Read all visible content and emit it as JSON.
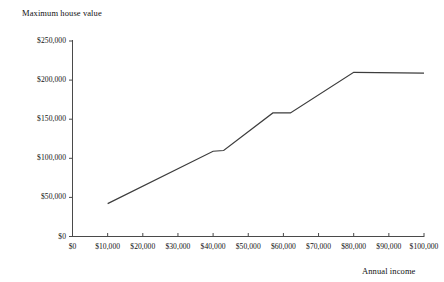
{
  "chart_data": {
    "type": "line",
    "title": "",
    "xlabel": "Annual income",
    "ylabel": "Maximum house value",
    "xlim": [
      0,
      100000
    ],
    "ylim": [
      0,
      250000
    ],
    "grid": false,
    "legend": "none",
    "x_ticks": [
      "$0",
      "$10,000",
      "$20,000",
      "$30,000",
      "$40,000",
      "$50,000",
      "$60,000",
      "$70,000",
      "$80,000",
      "$90,000",
      "$100,000"
    ],
    "x_tick_values": [
      0,
      10000,
      20000,
      30000,
      40000,
      50000,
      60000,
      70000,
      80000,
      90000,
      100000
    ],
    "y_ticks": [
      "$0",
      "$50,000",
      "$100,000",
      "$150,000",
      "$200,000",
      "$250,000"
    ],
    "y_tick_values": [
      0,
      50000,
      100000,
      150000,
      200000,
      250000
    ],
    "series": [
      {
        "name": "Maximum house value",
        "color": "#3d3d3d",
        "x": [
          10000,
          40000,
          43000,
          57000,
          62000,
          80000,
          100000
        ],
        "values": [
          42000,
          109000,
          110000,
          158000,
          158000,
          210000,
          209000
        ]
      }
    ]
  },
  "axes": {
    "y_title": "Maximum house value",
    "x_title": "Annual income"
  }
}
